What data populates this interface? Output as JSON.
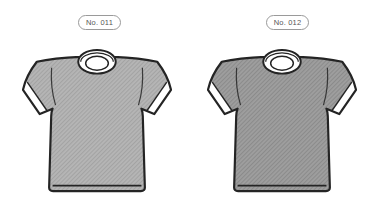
{
  "canvas": {
    "background": "#ffffff",
    "outline_color": "#242424",
    "trim_color": "#ffffff"
  },
  "items": [
    {
      "label": "No. 011",
      "colors": {
        "base": "#b5b5b5",
        "hatch": "#a3a3a3"
      }
    },
    {
      "label": "No. 012",
      "colors": {
        "base": "#9e9e9e",
        "hatch": "#8b8b8b"
      }
    }
  ]
}
